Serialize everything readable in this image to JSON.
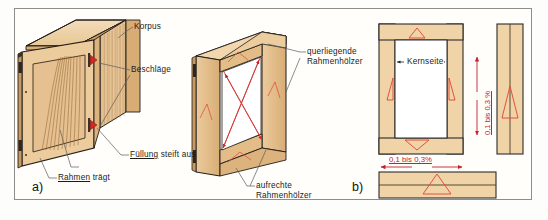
{
  "figure": {
    "border_color": "#8d8d8d",
    "background": "#fffefb"
  },
  "colors": {
    "wood_light": "#f2d7ae",
    "wood_mid": "#e2bb86",
    "wood_dark": "#c79a63",
    "wood_edge": "#8a6330",
    "outline": "#221d18",
    "accent_red": "#c8202a",
    "ring_red": "#e0533c",
    "leader": "#5b5b5b",
    "text": "#1b1b1b"
  },
  "panel_a": {
    "id": "a)",
    "labels": [
      {
        "key": "korpus",
        "text": "Korpus",
        "underline": false
      },
      {
        "key": "beschlaege",
        "text": "Beschläge",
        "underline": false
      },
      {
        "key": "fuellung",
        "underlined_word": "Füllung",
        "rest": " steift aus"
      },
      {
        "key": "rahmen",
        "underlined_word": "Rahmen",
        "rest": " trägt"
      }
    ]
  },
  "panel_a2": {
    "labels": [
      {
        "key": "querliegende",
        "line1": "querliegende",
        "line2": "Rahmenhölzer"
      },
      {
        "key": "aufrechte",
        "line1": "aufrechte",
        "line2": "Rahmenhölzer"
      }
    ]
  },
  "panel_b": {
    "id": "b)",
    "labels": [
      {
        "key": "kernseite",
        "text": "Kernseite"
      },
      {
        "key": "dim_vertical",
        "text": "0,1 bis 0,3 %"
      },
      {
        "key": "dim_horizontal",
        "text": "0,1 bis 0,3%"
      }
    ]
  }
}
